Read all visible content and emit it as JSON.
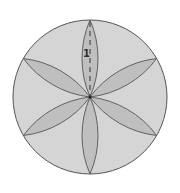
{
  "diagram": {
    "type": "geometry",
    "circle": {
      "cx": 90,
      "cy": 97,
      "r": 77
    },
    "petal_count": 6,
    "petal_angles_deg": [
      90,
      30,
      -30,
      -90,
      -150,
      150
    ],
    "petal_half_width": 8,
    "label": {
      "text": "1",
      "meaning": "radius length"
    },
    "colors": {
      "circle_fill": "#d5d5d5",
      "petal_fill": "#bfbfbf",
      "stroke": "#555555",
      "dashed": "#333333",
      "label": "#333333"
    }
  }
}
